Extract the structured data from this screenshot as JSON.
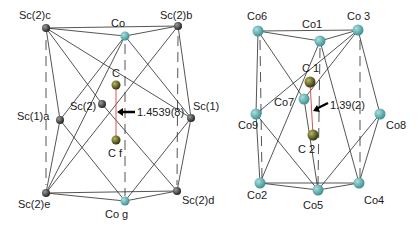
{
  "colors": {
    "sc_atom": "#2e2e2e",
    "co_atom": "#4fa8aa",
    "c_atom": "#4a4a12",
    "bond": "#2a2a2a",
    "cc_bond": "#e05050",
    "arrow": "#000000"
  },
  "left_cluster": {
    "labels": {
      "sc2c": "Sc(2)c",
      "co_top": "Co",
      "sc2b": "Sc(2)b",
      "c_top": "C",
      "sc2": "Sc(2)",
      "sc1a": "Sc(1)a",
      "sc1": "Sc(1)",
      "c_bottom": "C f",
      "sc2e": "Sc(2)e",
      "co_bottom": "Co g",
      "sc2d": "Sc(2)d",
      "bond_length": "1.4539(8)"
    }
  },
  "right_cluster": {
    "labels": {
      "co6": "Co6",
      "co1": "Co1",
      "co3": "Co 3",
      "c1": "C 1",
      "co7": "Co7",
      "co9": "Co9",
      "co8": "Co8",
      "c2": "C 2",
      "co2": "Co2",
      "co5": "Co5",
      "co4": "Co4",
      "bond_length": "1.39(2)"
    }
  }
}
